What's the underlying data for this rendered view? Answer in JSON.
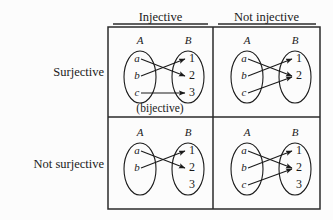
{
  "figure": {
    "background_color": "#fcfcfc",
    "ink_color": "#1a1a1a",
    "grid": {
      "x": 108,
      "y": 27,
      "width": 212,
      "height": 182,
      "mid_x": 213,
      "mid_y": 117
    }
  },
  "column_headers": [
    {
      "id": "injective",
      "label": "Injective"
    },
    {
      "id": "not-injective",
      "label": "Not injective"
    }
  ],
  "row_headers": [
    {
      "id": "surjective",
      "label": "Surjective"
    },
    {
      "id": "not-surjective",
      "label": "Not surjective"
    }
  ],
  "set_labels": {
    "domain": "A",
    "codomain": "B"
  },
  "cells": [
    {
      "id": "surjective-injective",
      "row": "Surjective",
      "column": "Injective",
      "caption": "(bijective)",
      "domain_elements": [
        "a",
        "b",
        "c"
      ],
      "codomain_elements": [
        "1",
        "2",
        "3"
      ],
      "mappings": [
        {
          "from": "a",
          "to": "2"
        },
        {
          "from": "b",
          "to": "1"
        },
        {
          "from": "c",
          "to": "3"
        }
      ]
    },
    {
      "id": "surjective-not-injective",
      "row": "Surjective",
      "column": "Not injective",
      "caption": "",
      "domain_elements": [
        "a",
        "b",
        "c"
      ],
      "codomain_elements": [
        "1",
        "2"
      ],
      "mappings": [
        {
          "from": "a",
          "to": "2"
        },
        {
          "from": "b",
          "to": "1"
        },
        {
          "from": "c",
          "to": "2"
        }
      ]
    },
    {
      "id": "not-surjective-injective",
      "row": "Not surjective",
      "column": "Injective",
      "caption": "",
      "domain_elements": [
        "a",
        "b"
      ],
      "codomain_elements": [
        "1",
        "2",
        "3"
      ],
      "mappings": [
        {
          "from": "a",
          "to": "2"
        },
        {
          "from": "b",
          "to": "1"
        }
      ]
    },
    {
      "id": "not-surjective-not-injective",
      "row": "Not surjective",
      "column": "Not injective",
      "caption": "",
      "domain_elements": [
        "a",
        "b",
        "c"
      ],
      "codomain_elements": [
        "1",
        "2",
        "3"
      ],
      "mappings": [
        {
          "from": "a",
          "to": "2"
        },
        {
          "from": "b",
          "to": "1"
        },
        {
          "from": "c",
          "to": "2"
        }
      ]
    }
  ]
}
